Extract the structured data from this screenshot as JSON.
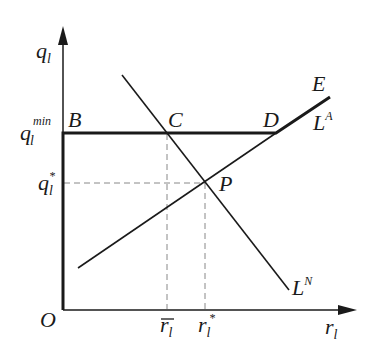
{
  "diagram": {
    "axes": {
      "y_label": "q",
      "y_sub": "l",
      "x_label": "r",
      "x_sub": "l",
      "origin": "O"
    },
    "y_ticks": [
      {
        "label": "q",
        "sub": "l",
        "sup": "min"
      },
      {
        "label": "q",
        "sub": "l",
        "sup": "*"
      }
    ],
    "x_ticks": [
      {
        "label": "r",
        "sub": "l",
        "accent": "bar"
      },
      {
        "label": "r",
        "sub": "l",
        "sup": "*"
      }
    ],
    "points": {
      "B": "B",
      "C": "C",
      "D": "D",
      "E": "E",
      "P": "P"
    },
    "curves": {
      "LA": {
        "label": "L",
        "sup": "A"
      },
      "LN": {
        "label": "L",
        "sup": "N"
      }
    },
    "colors": {
      "line": "#1a1a1a",
      "dashed": "#888888"
    }
  }
}
